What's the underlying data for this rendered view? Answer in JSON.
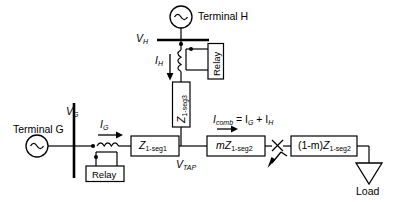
{
  "diagram": {
    "type": "single-line power system diagram",
    "colors": {
      "line": "#000000",
      "fill": "#ffffff",
      "text": "#000000"
    }
  },
  "sources": [
    {
      "id": "terminal-h",
      "label": "Terminal H",
      "symbol": "ac-source-icon"
    },
    {
      "id": "terminal-g",
      "label": "Terminal G",
      "symbol": "ac-source-icon"
    }
  ],
  "buses": [
    {
      "id": "bus-h",
      "label": "V",
      "sub": "H",
      "orientation": "horizontal"
    },
    {
      "id": "bus-g",
      "label": "V",
      "sub": "G",
      "orientation": "vertical"
    }
  ],
  "nodes": [
    {
      "id": "tap-node",
      "label": "V",
      "sub": "TAP"
    }
  ],
  "currents": [
    {
      "id": "current-h",
      "label": "I",
      "sub": "H",
      "direction": "down"
    },
    {
      "id": "current-g",
      "label": "I",
      "sub": "G",
      "direction": "right"
    },
    {
      "id": "current-comb",
      "label": "I",
      "sub": "comb",
      "equation_rest": " = I",
      "sub2": "G",
      "plus": " + I",
      "sub3": "H",
      "direction": "right"
    }
  ],
  "impedance_blocks": [
    {
      "id": "z-seg3",
      "prefix": "",
      "main": "Z",
      "sub": "1-seg3",
      "orientation": "vertical"
    },
    {
      "id": "z-seg1",
      "prefix": "",
      "main": "Z",
      "sub": "1-seg1",
      "orientation": "horizontal"
    },
    {
      "id": "mz-seg2",
      "prefix": "m",
      "main": "Z",
      "sub": "1-seg2",
      "orientation": "horizontal"
    },
    {
      "id": "one-minus-m-z-seg2",
      "prefix": "(1-m)",
      "main": "Z",
      "sub": "1-seg2",
      "orientation": "horizontal"
    }
  ],
  "relays": [
    {
      "id": "relay-h",
      "label": "Relay",
      "orientation": "vertical"
    },
    {
      "id": "relay-g",
      "label": "Relay",
      "orientation": "horizontal"
    }
  ],
  "fault": {
    "id": "fault-marker",
    "symbol": "fault-cross-arrow-icon",
    "label": ""
  },
  "load": {
    "id": "load-terminal",
    "label": "Load",
    "symbol": "load-triangle-icon"
  },
  "cts": [
    {
      "id": "ct-h",
      "orientation": "vertical",
      "symbol": "current-transformer-icon"
    },
    {
      "id": "ct-g",
      "orientation": "horizontal",
      "symbol": "current-transformer-icon"
    }
  ]
}
